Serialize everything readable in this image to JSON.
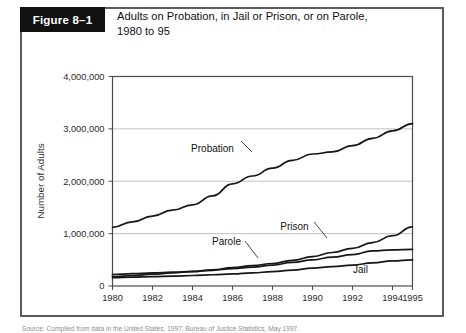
{
  "figure": {
    "number_label": "Figure 8–1",
    "title_line1": "Adults on Probation, in Jail or Prison, or on Parole,",
    "title_line2": "1980 to 95",
    "source_note": "Source: Compiled from data in the United States, 1997, Bureau of Justice Statistics, May 1997."
  },
  "chart_data": {
    "type": "line",
    "title": "Adults on Probation, in Jail or Prison, or on Parole, 1980 to 95",
    "xlabel": "",
    "ylabel": "Number of Adults",
    "xlim": [
      1980,
      1995
    ],
    "ylim": [
      0,
      4000000
    ],
    "grid": true,
    "legend_position": "inline-annotations",
    "x": [
      1980,
      1981,
      1982,
      1983,
      1984,
      1985,
      1986,
      1987,
      1988,
      1989,
      1990,
      1991,
      1992,
      1993,
      1994,
      1995
    ],
    "xticks": [
      1980,
      1982,
      1984,
      1986,
      1988,
      1990,
      1992,
      1994,
      1995
    ],
    "xtick_labels": [
      "1980",
      "1982",
      "1984",
      "1986",
      "1988",
      "1990",
      "1992",
      "1994",
      "1995"
    ],
    "yticks": [
      0,
      1000000,
      2000000,
      3000000,
      4000000
    ],
    "ytick_labels": [
      "0",
      "1,000,000",
      "2,000,000",
      "3,000,000",
      "4,000,000"
    ],
    "series": [
      {
        "name": "Probation",
        "values": [
          1120000,
          1225000,
          1335000,
          1450000,
          1550000,
          1720000,
          1950000,
          2100000,
          2250000,
          2400000,
          2520000,
          2560000,
          2680000,
          2820000,
          2960000,
          3100000
        ]
      },
      {
        "name": "Prison",
        "values": [
          180000,
          200000,
          225000,
          250000,
          275000,
          310000,
          350000,
          390000,
          430000,
          490000,
          560000,
          640000,
          720000,
          830000,
          960000,
          1130000
        ]
      },
      {
        "name": "Parole",
        "values": [
          220000,
          235000,
          250000,
          265000,
          280000,
          300000,
          330000,
          360000,
          400000,
          450000,
          500000,
          550000,
          600000,
          670000,
          690000,
          700000
        ]
      },
      {
        "name": "Jail",
        "values": [
          160000,
          170000,
          180000,
          190000,
          200000,
          215000,
          230000,
          250000,
          275000,
          305000,
          340000,
          370000,
          400000,
          440000,
          480000,
          500000
        ]
      }
    ],
    "annotations": [
      {
        "label": "Probation",
        "x": 1985.0,
        "y": 2550000
      },
      {
        "label": "Prison",
        "x": 1989.1,
        "y": 1060000
      },
      {
        "label": "Parole",
        "x": 1985.7,
        "y": 790000
      },
      {
        "label": "Jail",
        "x": 1992.4,
        "y": 250000
      }
    ]
  }
}
